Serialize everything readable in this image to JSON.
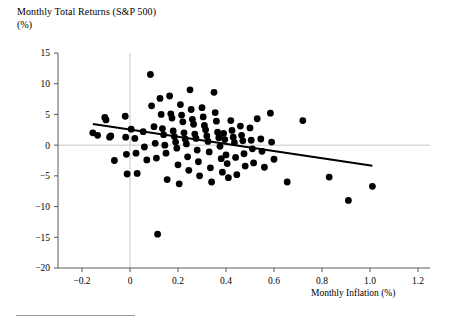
{
  "figure": {
    "title_line1": "Monthly Total Returns (S&P 500)",
    "title_line2": "(%)",
    "xaxis_title": "Monthly Inflation (%)"
  },
  "chart_data": {
    "type": "scatter",
    "title": "Monthly Total Returns (S&P 500) (%)",
    "xlabel": "Monthly Inflation (%)",
    "ylabel": "Monthly Total Returns (S&P 500) (%)",
    "xlim": [
      -0.3,
      1.25
    ],
    "ylim": [
      -20,
      15
    ],
    "xticks": [
      "-0.2",
      "0",
      "0.2",
      "0.4",
      "0.6",
      "0.8",
      "1.0",
      "1.2"
    ],
    "xtick_values": [
      -0.2,
      0,
      0.2,
      0.4,
      0.6,
      0.8,
      1.0,
      1.2
    ],
    "yticks": [
      "15",
      "10",
      "5",
      "0",
      "-5",
      "-10",
      "-15",
      "-20"
    ],
    "ytick_values": [
      15,
      10,
      5,
      0,
      -5,
      -10,
      -15,
      -20
    ],
    "grid": false,
    "zero_lines": {
      "horizontal_y": 0,
      "vertical_x": 0,
      "color": "#c8c8c8"
    },
    "legend": null,
    "marker": {
      "shape": "circle",
      "color": "#000000",
      "size": 3.4
    },
    "trendline": {
      "type": "linear-fit",
      "color": "#000000",
      "width": 2,
      "x_start": -0.155,
      "y_start": 3.45,
      "x_end": 1.01,
      "y_end": -3.35,
      "slope": -5.84,
      "intercept": 2.54
    },
    "points": [
      [
        -0.155,
        2.0
      ],
      [
        -0.135,
        1.6
      ],
      [
        -0.105,
        4.5
      ],
      [
        -0.1,
        4.1
      ],
      [
        -0.085,
        1.3
      ],
      [
        -0.08,
        1.5
      ],
      [
        -0.065,
        -2.5
      ],
      [
        -0.02,
        4.7
      ],
      [
        -0.018,
        1.3
      ],
      [
        -0.015,
        -1.5
      ],
      [
        -0.012,
        -4.7
      ],
      [
        0.005,
        2.6
      ],
      [
        0.02,
        1.1
      ],
      [
        0.025,
        -1.3
      ],
      [
        0.03,
        -4.6
      ],
      [
        0.055,
        2.2
      ],
      [
        0.06,
        -0.3
      ],
      [
        0.07,
        -2.4
      ],
      [
        0.085,
        11.5
      ],
      [
        0.09,
        6.4
      ],
      [
        0.1,
        3.0
      ],
      [
        0.105,
        0.3
      ],
      [
        0.11,
        -2.1
      ],
      [
        0.115,
        -14.5
      ],
      [
        0.125,
        7.6
      ],
      [
        0.13,
        5.0
      ],
      [
        0.135,
        2.7
      ],
      [
        0.14,
        1.7
      ],
      [
        0.145,
        0.0
      ],
      [
        0.15,
        -1.3
      ],
      [
        0.155,
        -5.6
      ],
      [
        0.165,
        8.0
      ],
      [
        0.17,
        5.1
      ],
      [
        0.175,
        4.4
      ],
      [
        0.18,
        2.3
      ],
      [
        0.185,
        1.4
      ],
      [
        0.19,
        0.5
      ],
      [
        0.195,
        -0.5
      ],
      [
        0.2,
        -3.2
      ],
      [
        0.205,
        -6.3
      ],
      [
        0.21,
        6.6
      ],
      [
        0.215,
        4.9
      ],
      [
        0.22,
        3.8
      ],
      [
        0.225,
        2.0
      ],
      [
        0.23,
        1.0
      ],
      [
        0.235,
        0.2
      ],
      [
        0.24,
        -1.9
      ],
      [
        0.245,
        -4.1
      ],
      [
        0.25,
        9.0
      ],
      [
        0.255,
        5.8
      ],
      [
        0.26,
        4.2
      ],
      [
        0.265,
        3.4
      ],
      [
        0.27,
        1.8
      ],
      [
        0.275,
        1.1
      ],
      [
        0.28,
        -0.8
      ],
      [
        0.285,
        -2.7
      ],
      [
        0.29,
        -5.0
      ],
      [
        0.3,
        6.1
      ],
      [
        0.305,
        4.6
      ],
      [
        0.31,
        3.2
      ],
      [
        0.315,
        2.5
      ],
      [
        0.32,
        1.5
      ],
      [
        0.325,
        0.6
      ],
      [
        0.33,
        -1.1
      ],
      [
        0.335,
        -3.7
      ],
      [
        0.34,
        -6.0
      ],
      [
        0.35,
        8.6
      ],
      [
        0.355,
        5.3
      ],
      [
        0.36,
        3.9
      ],
      [
        0.365,
        2.1
      ],
      [
        0.37,
        1.2
      ],
      [
        0.375,
        -0.2
      ],
      [
        0.38,
        -2.2
      ],
      [
        0.385,
        -4.4
      ],
      [
        0.39,
        1.9
      ],
      [
        0.395,
        0.9
      ],
      [
        0.4,
        -1.6
      ],
      [
        0.405,
        -3.0
      ],
      [
        0.41,
        -5.3
      ],
      [
        0.42,
        4.0
      ],
      [
        0.425,
        2.4
      ],
      [
        0.43,
        1.3
      ],
      [
        0.435,
        0.4
      ],
      [
        0.44,
        -2.0
      ],
      [
        0.445,
        -4.8
      ],
      [
        0.46,
        3.1
      ],
      [
        0.465,
        1.6
      ],
      [
        0.47,
        0.7
      ],
      [
        0.475,
        -1.4
      ],
      [
        0.48,
        -3.4
      ],
      [
        0.5,
        2.8
      ],
      [
        0.505,
        0.8
      ],
      [
        0.51,
        -0.6
      ],
      [
        0.515,
        -2.9
      ],
      [
        0.53,
        4.3
      ],
      [
        0.545,
        1.0
      ],
      [
        0.55,
        -1.0
      ],
      [
        0.56,
        -3.6
      ],
      [
        0.585,
        5.2
      ],
      [
        0.59,
        0.5
      ],
      [
        0.6,
        -2.3
      ],
      [
        0.655,
        -6.0
      ],
      [
        0.72,
        4.0
      ],
      [
        0.83,
        -5.2
      ],
      [
        0.91,
        -9.0
      ],
      [
        1.01,
        -6.7
      ]
    ]
  }
}
